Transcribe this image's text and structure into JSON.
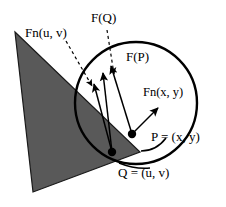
{
  "figure": {
    "title": "",
    "background_color": "#ffffff",
    "stroke_color": "#000000",
    "triangle_fill": "#595959",
    "labels": {
      "fn_uv": "Fn(u, v)",
      "f_q": "F(Q)",
      "f_p": "F(P)",
      "fn_xy": "Fn(x, y)",
      "point_p": "P = (x, y)",
      "point_q": "Q = (u, v)"
    },
    "shapes": {
      "triangle": {
        "name": "shaded-triangle",
        "points": "15,32 140,152 33,192"
      },
      "circle": {
        "name": "boundary-circle",
        "cx": 136,
        "cy": 103,
        "r": 61
      },
      "point_p": {
        "cx": 132,
        "cy": 134,
        "r": 4
      },
      "point_q": {
        "cx": 112,
        "cy": 152,
        "r": 4
      }
    },
    "vectors": {
      "from_p": [
        {
          "name": "vector-f-p",
          "x1": 132,
          "y1": 134,
          "x2": 110,
          "y2": 65
        },
        {
          "name": "vector-fn-xy",
          "x1": 132,
          "y1": 134,
          "x2": 158,
          "y2": 108
        }
      ],
      "from_q": [
        {
          "name": "vector-f-q-solid",
          "x1": 112,
          "y1": 152,
          "x2": 102,
          "y2": 72
        },
        {
          "name": "vector-fn-uv-solid",
          "x1": 112,
          "y1": 152,
          "x2": 94,
          "y2": 83
        }
      ],
      "leaders": [
        {
          "name": "leader-fn-uv",
          "x1": 67,
          "y1": 40,
          "x2": 92,
          "y2": 86
        },
        {
          "name": "leader-f-q",
          "x1": 108,
          "y1": 30,
          "x2": 113,
          "y2": 76
        }
      ],
      "callouts": [
        {
          "name": "callout-p-curve",
          "d": "M 140 151 C 152 151 160 146 165 139"
        },
        {
          "name": "callout-q-curve",
          "d": "M 176 144 C 172 155 166 162 158 166"
        }
      ]
    },
    "label_positions": {
      "fn_uv": {
        "x": 25,
        "y": 36
      },
      "f_q": {
        "x": 91,
        "y": 21
      },
      "f_p": {
        "x": 127,
        "y": 60
      },
      "fn_xy": {
        "x": 144,
        "y": 95
      },
      "point_p": {
        "x": 152,
        "y": 140
      },
      "point_q": {
        "x": 118,
        "y": 172
      }
    }
  }
}
